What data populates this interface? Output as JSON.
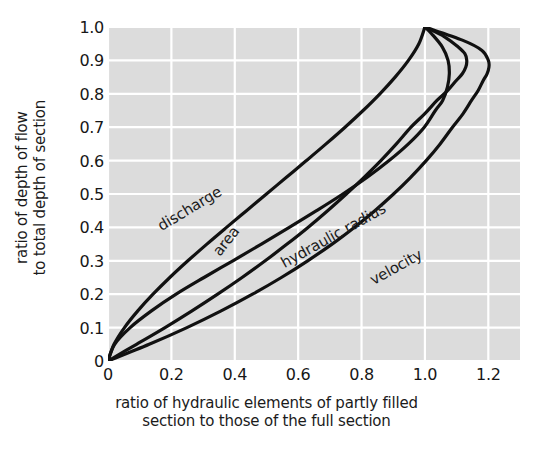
{
  "chart_data": {
    "type": "line",
    "title": "",
    "xlabel": "ratio of hydraulic elements of partly filled section to those of the full section",
    "xlabel_line1": "ratio of hydraulic elements of partly filled",
    "xlabel_line2": "section to those of the full section",
    "ylabel": "ratio of depth of flow to total depth of section",
    "ylabel_line1": "ratio of depth of flow",
    "ylabel_line2": "to total depth of section",
    "xlim": [
      0,
      1.3
    ],
    "ylim": [
      0,
      1.0
    ],
    "grid": true,
    "legend_position": "inline-curve-labels",
    "plot_background": "#dcdcdc",
    "gridline_color": "#ffffff",
    "curve_color": "#111111",
    "xticks": [
      "0",
      "0.2",
      "0.4",
      "0.6",
      "0.8",
      "1.0",
      "1.2"
    ],
    "xtick_values": [
      0,
      0.2,
      0.4,
      0.6,
      0.8,
      1.0,
      1.2
    ],
    "yticks": [
      "0",
      "0.1",
      "0.2",
      "0.3",
      "0.4",
      "0.5",
      "0.6",
      "0.7",
      "0.8",
      "0.9",
      "1.0"
    ],
    "ytick_values": [
      0,
      0.1,
      0.2,
      0.3,
      0.4,
      0.5,
      0.6,
      0.7,
      0.8,
      0.9,
      1.0
    ],
    "series": [
      {
        "name": "discharge",
        "label": "discharge",
        "label_rotation": -31,
        "x": [
          0.0,
          0.021,
          0.07,
          0.137,
          0.215,
          0.303,
          0.394,
          0.484,
          0.572,
          0.658,
          0.741,
          0.818,
          0.887,
          0.948,
          0.998,
          1.033,
          1.056,
          1.071,
          1.077,
          1.073,
          1.055,
          1.021,
          1.0
        ],
        "y": [
          0.0,
          0.05,
          0.1,
          0.15,
          0.2,
          0.25,
          0.3,
          0.35,
          0.4,
          0.45,
          0.5,
          0.55,
          0.6,
          0.65,
          0.7,
          0.75,
          0.78,
          0.82,
          0.86,
          0.9,
          0.94,
          0.98,
          1.0
        ]
      },
      {
        "name": "area",
        "label": "area",
        "label_rotation": -52,
        "x": [
          0.0,
          0.019,
          0.052,
          0.094,
          0.142,
          0.195,
          0.252,
          0.312,
          0.374,
          0.437,
          0.5,
          0.563,
          0.626,
          0.688,
          0.748,
          0.805,
          0.858,
          0.906,
          0.948,
          0.981,
          1.0
        ],
        "y": [
          0.0,
          0.05,
          0.1,
          0.15,
          0.2,
          0.25,
          0.3,
          0.35,
          0.4,
          0.45,
          0.5,
          0.55,
          0.6,
          0.65,
          0.7,
          0.75,
          0.8,
          0.85,
          0.9,
          0.95,
          1.0
        ]
      },
      {
        "name": "hydraulic radius",
        "label": "hydraulic radius",
        "label_rotation": -29,
        "x": [
          0.0,
          0.13,
          0.249,
          0.357,
          0.456,
          0.547,
          0.63,
          0.707,
          0.777,
          0.842,
          0.901,
          0.955,
          1.004,
          1.048,
          1.087,
          1.12,
          1.147,
          1.168,
          1.184,
          1.196,
          1.202,
          1.2,
          1.18,
          1.12,
          1.0
        ],
        "y": [
          0.0,
          0.05,
          0.1,
          0.15,
          0.2,
          0.25,
          0.3,
          0.35,
          0.4,
          0.45,
          0.5,
          0.55,
          0.6,
          0.65,
          0.7,
          0.74,
          0.78,
          0.81,
          0.84,
          0.86,
          0.88,
          0.9,
          0.93,
          0.96,
          1.0
        ]
      },
      {
        "name": "velocity",
        "label": "velocity",
        "label_rotation": -29,
        "x": [
          0.0,
          0.09,
          0.18,
          0.265,
          0.346,
          0.423,
          0.496,
          0.565,
          0.631,
          0.693,
          0.752,
          0.808,
          0.861,
          0.91,
          0.956,
          0.999,
          1.038,
          1.072,
          1.099,
          1.118,
          1.129,
          1.132,
          1.126,
          1.105,
          1.063,
          1.0
        ],
        "y": [
          0.0,
          0.05,
          0.1,
          0.15,
          0.2,
          0.25,
          0.3,
          0.35,
          0.4,
          0.45,
          0.5,
          0.55,
          0.6,
          0.65,
          0.7,
          0.74,
          0.78,
          0.81,
          0.84,
          0.86,
          0.88,
          0.9,
          0.92,
          0.94,
          0.97,
          1.0
        ]
      }
    ],
    "annotations": [
      {
        "text": "discharge",
        "x": 0.16,
        "y": 0.4
      },
      {
        "text": "area",
        "x": 0.34,
        "y": 0.32
      },
      {
        "text": "hydraulic radius",
        "x": 0.55,
        "y": 0.29
      },
      {
        "text": "velocity",
        "x": 0.83,
        "y": 0.24
      }
    ]
  }
}
